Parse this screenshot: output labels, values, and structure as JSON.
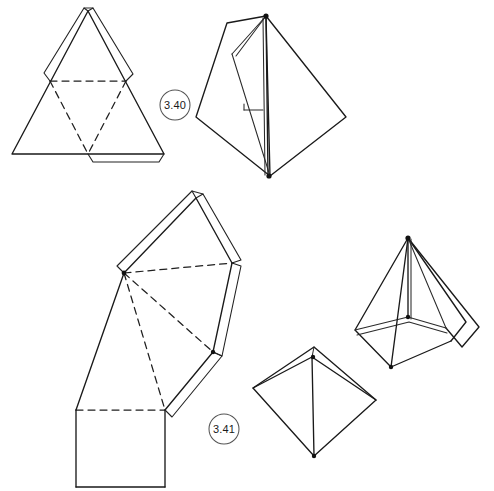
{
  "page": {
    "background_color": "#ffffff",
    "width": 494,
    "height": 491
  },
  "style": {
    "ink_color": "#1a1a1a",
    "dashed_stroke": "#1f1f1f",
    "label_circle_stroke": "#555555"
  },
  "figures": [
    {
      "id": "fig-3-40",
      "label": "3.40",
      "caption_label": "3.40",
      "description": "Tetrahedron: flat net at left, assembled solid at right",
      "parts": [
        {
          "name": "tetrahedron-net",
          "kind": "net",
          "shape": "triangle-net-with-glue-flaps",
          "fold_lines": "dashed",
          "cut_lines": "solid"
        },
        {
          "name": "tetrahedron-solid",
          "kind": "solid",
          "shape": "tetrahedron-partially-folded"
        }
      ]
    },
    {
      "id": "fig-3-41",
      "label": "3.41",
      "caption_label": "3.41",
      "description": "Square pyramid: flat net at left, assembled solids at right",
      "parts": [
        {
          "name": "square-pyramid-net",
          "kind": "net",
          "shape": "pyramid-net-with-glue-flaps",
          "fold_lines": "dashed",
          "cut_lines": "solid"
        },
        {
          "name": "square-pyramid-solid-front",
          "kind": "solid",
          "shape": "square-pyramid-top-view"
        },
        {
          "name": "square-pyramid-solid-open",
          "kind": "solid",
          "shape": "square-pyramid-with-open-flap"
        }
      ]
    }
  ],
  "labels": {
    "fig_340": "3.40",
    "fig_341": "3.41"
  }
}
